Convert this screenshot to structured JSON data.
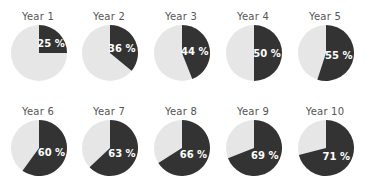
{
  "chart_data": {
    "type": "pie",
    "title": "",
    "layout": {
      "rows": 2,
      "cols": 5
    },
    "colors": {
      "share": "#333333",
      "remainder": "#e6e6e6",
      "title": "#555555",
      "label": "#ffffff"
    },
    "series": [
      {
        "name": "Year 1",
        "value": 25,
        "label": "25 %"
      },
      {
        "name": "Year 2",
        "value": 36,
        "label": "36 %"
      },
      {
        "name": "Year 3",
        "value": 44,
        "label": "44 %"
      },
      {
        "name": "Year 4",
        "value": 50,
        "label": "50 %"
      },
      {
        "name": "Year 5",
        "value": 55,
        "label": "55 %"
      },
      {
        "name": "Year 6",
        "value": 60,
        "label": "60 %"
      },
      {
        "name": "Year 7",
        "value": 63,
        "label": "63 %"
      },
      {
        "name": "Year 8",
        "value": 66,
        "label": "66 %"
      },
      {
        "name": "Year 9",
        "value": 69,
        "label": "69 %"
      },
      {
        "name": "Year 10",
        "value": 71,
        "label": "71 %"
      }
    ]
  }
}
